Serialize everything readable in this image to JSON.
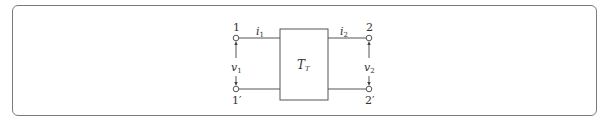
{
  "diagram": {
    "type": "two-port network",
    "block_label": "T",
    "block_label_sub": "T",
    "ports": {
      "port1": {
        "top_terminal": "1",
        "bottom_terminal": "1′",
        "current": "i",
        "current_sub": "1",
        "voltage": "v",
        "voltage_sub": "1"
      },
      "port2": {
        "top_terminal": "2",
        "bottom_terminal": "2′",
        "current": "i",
        "current_sub": "2",
        "voltage": "v",
        "voltage_sub": "2"
      }
    }
  }
}
